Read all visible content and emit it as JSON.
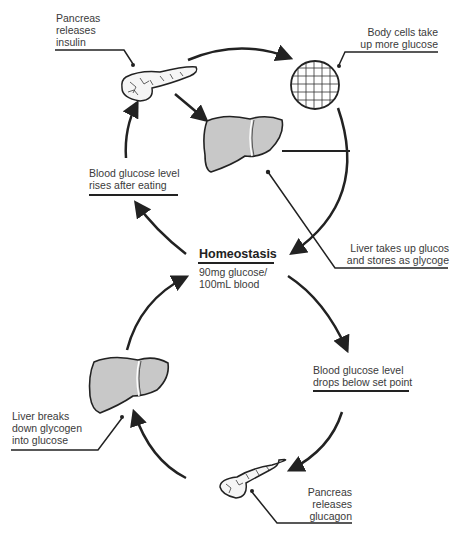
{
  "diagram": {
    "type": "cycle",
    "center": {
      "title": "Homeostasis",
      "line1": "90mg glucose/",
      "line2": "100mL blood"
    },
    "labels": {
      "pancreas_insulin": "Pancreas\nreleases\ninsulin",
      "body_cells": "Body cells take\nup more glucose",
      "glucose_rises": "Blood glucose level\nrises after eating",
      "liver_stores": "Liver takes up glucos\nand stores as glycoge",
      "glucose_drops": "Blood glucose level\ndrops below set point",
      "liver_breaks": "Liver breaks\ndown glycogen\ninto glucose",
      "pancreas_glucagon": "Pancreas\nreleases\nglucagon"
    },
    "icons": [
      "pancreas-icon",
      "body-cells-icon",
      "liver-icon",
      "liver-icon",
      "pancreas-icon"
    ],
    "colors": {
      "line": "#222222",
      "organ_fill": "#c8c8c8",
      "text": "#3a3a3a"
    }
  }
}
